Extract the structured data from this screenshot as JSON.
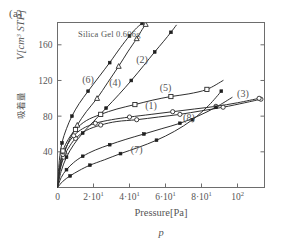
{
  "panel": {
    "label": "(a)"
  },
  "annotation": {
    "sample_text": "Silica Gel  0.606g"
  },
  "axes": {
    "x_title": "Pressure[Pa]",
    "x_symbol": "p",
    "y_title_cjk": "吸着量",
    "y_title_sym": "V[cm",
    "y_title_sup": "3",
    "y_title_unit": " STP]"
  },
  "chart_data": {
    "type": "line",
    "title": "",
    "subtitle": "",
    "annotation": "Silica Gel  0.606g",
    "xlabel": "Pressure[Pa]",
    "ylabel": "吸着量 V[cm3 STP]",
    "xlim": [
      0,
      115
    ],
    "ylim": [
      0,
      185
    ],
    "grid": false,
    "legend": "inline-curve-labels",
    "x_ticks": [
      {
        "value": 0,
        "label": "0",
        "mantissa": "0",
        "exponent": ""
      },
      {
        "value": 20,
        "label": "2·10^1",
        "mantissa": "2·10",
        "exponent": "1"
      },
      {
        "value": 40,
        "label": "4·10^1",
        "mantissa": "4·10",
        "exponent": "1"
      },
      {
        "value": 60,
        "label": "6·10^1",
        "mantissa": "6·10",
        "exponent": "1"
      },
      {
        "value": 80,
        "label": "8·10^1",
        "mantissa": "8·10",
        "exponent": "1"
      },
      {
        "value": 100,
        "label": "10^2",
        "mantissa": "10",
        "exponent": "2"
      }
    ],
    "y_ticks": [
      {
        "value": 40,
        "label": "40"
      },
      {
        "value": 80,
        "label": "80"
      },
      {
        "value": 120,
        "label": "120"
      },
      {
        "value": 160,
        "label": "160"
      }
    ],
    "series": [
      {
        "name": "(1)",
        "label": "(1)",
        "marker": "open-circle",
        "label_x": 52,
        "label_y": 88,
        "x": [
          0,
          1.5,
          3.5,
          6,
          10,
          16,
          24,
          33,
          44,
          56,
          68,
          80,
          92,
          104,
          113
        ],
        "y": [
          0,
          20,
          34,
          44,
          55,
          64,
          70,
          74,
          76,
          79,
          82,
          86,
          90,
          95,
          99
        ]
      },
      {
        "name": "(2)",
        "label": "(2)",
        "marker": "filled-square",
        "label_x": 47,
        "label_y": 140,
        "x": [
          0,
          2,
          5,
          9,
          14,
          20,
          27,
          34,
          41,
          48,
          54,
          59,
          63,
          66
        ],
        "y": [
          0,
          18,
          34,
          48,
          61,
          74,
          89,
          104,
          120,
          137,
          152,
          164,
          174,
          182
        ]
      },
      {
        "name": "(3)",
        "label": "(3)",
        "marker": "open-circle",
        "label_x": 103,
        "label_y": 101,
        "x": [
          0,
          1.2,
          3,
          5.5,
          9,
          14,
          21,
          30,
          40,
          52,
          64,
          76,
          88,
          100,
          112
        ],
        "y": [
          0,
          22,
          37,
          48,
          58,
          66,
          72,
          76,
          79,
          82,
          85,
          88,
          91,
          95,
          100
        ]
      },
      {
        "name": "(4)",
        "label": "(4)",
        "marker": "open-triangle",
        "label_x": 32,
        "label_y": 114,
        "x": [
          0,
          1.5,
          4,
          7,
          11,
          16,
          22,
          28,
          34,
          39,
          44,
          47,
          49
        ],
        "y": [
          0,
          22,
          40,
          55,
          70,
          85,
          100,
          118,
          136,
          152,
          167,
          177,
          183
        ]
      },
      {
        "name": "(5)",
        "label": "(5)",
        "marker": "open-square",
        "label_x": 60,
        "label_y": 108,
        "x": [
          0,
          1.2,
          3,
          6,
          10,
          16,
          24,
          33,
          43,
          53,
          63,
          73,
          83,
          92
        ],
        "y": [
          0,
          24,
          41,
          54,
          65,
          75,
          82,
          88,
          93,
          98,
          102,
          105,
          110,
          120
        ]
      },
      {
        "name": "(6)",
        "label": "(6)",
        "marker": "filled-square",
        "label_x": 17,
        "label_y": 117,
        "x": [
          0,
          1,
          2.5,
          5,
          8,
          12,
          17,
          23,
          29,
          35,
          40,
          44,
          47
        ],
        "y": [
          0,
          30,
          50,
          66,
          80,
          94,
          108,
          124,
          140,
          157,
          170,
          179,
          184
        ]
      },
      {
        "name": "(7)",
        "label": "(7)",
        "marker": "filled-square",
        "label_x": 44,
        "label_y": 39,
        "x": [
          0,
          2,
          5,
          9,
          14,
          21,
          29,
          38,
          48,
          58,
          68,
          78,
          88,
          97
        ],
        "y": [
          0,
          11,
          20,
          28,
          35,
          42,
          48,
          54,
          60,
          66,
          72,
          80,
          90,
          101
        ]
      },
      {
        "name": "(8)",
        "label": "(8)",
        "marker": "filled-square",
        "label_x": 73,
        "label_y": 75,
        "x": [
          0,
          3,
          7,
          12,
          18,
          26,
          35,
          45,
          55,
          65,
          75,
          84,
          91
        ],
        "y": [
          0,
          7,
          13,
          19,
          25,
          31,
          38,
          45,
          53,
          63,
          76,
          92,
          108
        ]
      }
    ]
  }
}
